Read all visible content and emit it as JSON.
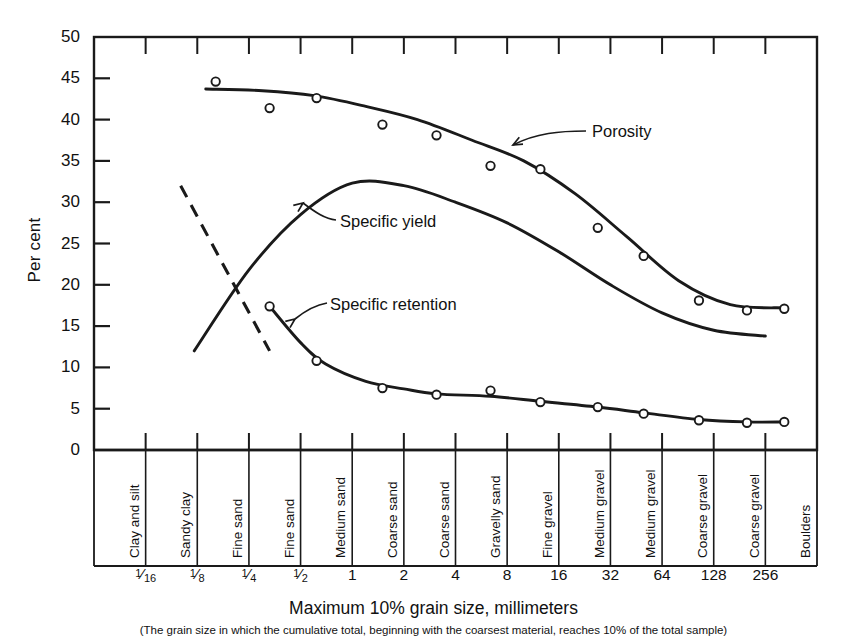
{
  "axes": {
    "ylabel": "Per cent",
    "xlabel": "Maximum 10% grain size, millimeters",
    "xnote": "(The grain size in which the cumulative total, beginning with the coarsest material, reaches 10% of the total sample)",
    "yticks": [
      "0",
      "5",
      "10",
      "15",
      "20",
      "25",
      "30",
      "35",
      "40",
      "45",
      "50"
    ]
  },
  "xticks": [
    {
      "label": "1/16",
      "num": "1",
      "den": "16"
    },
    {
      "label": "1/8",
      "num": "1",
      "den": "8"
    },
    {
      "label": "1/4",
      "num": "1",
      "den": "4"
    },
    {
      "label": "1/2",
      "num": "1",
      "den": "2"
    },
    {
      "label": "1"
    },
    {
      "label": "2"
    },
    {
      "label": "4"
    },
    {
      "label": "8"
    },
    {
      "label": "16"
    },
    {
      "label": "32"
    },
    {
      "label": "64"
    },
    {
      "label": "128"
    },
    {
      "label": "256"
    }
  ],
  "categories": [
    "Clay and silt",
    "Sandy clay",
    "Fine sand",
    "Fine sand",
    "Medium sand",
    "Coarse sand",
    "Coarse sand",
    "Gravelly sand",
    "Fine gravel",
    "Medium gravel",
    "Medium gravel",
    "Coarse gravel",
    "Coarse gravel",
    "Boulders"
  ],
  "curve_labels": {
    "porosity": "Porosity",
    "specific_yield": "Specific yield",
    "specific_retention": "Specific retention"
  },
  "chart_data": {
    "type": "line",
    "title": "",
    "xlabel": "Maximum 10% grain size, millimeters",
    "ylabel": "Per cent",
    "ylim": [
      0,
      50
    ],
    "ytick_step": 5,
    "grid": false,
    "legend": "inline-annotations",
    "x_scale": "log2 (category bands)",
    "x_tick_values": [
      0.0625,
      0.125,
      0.25,
      0.5,
      1,
      2,
      4,
      8,
      16,
      32,
      64,
      128,
      256
    ],
    "x_categories": [
      "Clay and silt",
      "Sandy clay",
      "Fine sand",
      "Fine sand",
      "Medium sand",
      "Coarse sand",
      "Coarse sand",
      "Gravelly sand",
      "Fine gravel",
      "Medium gravel",
      "Medium gravel",
      "Coarse gravel",
      "Coarse gravel",
      "Boulders"
    ],
    "series": [
      {
        "name": "Porosity",
        "marker": "open-circle",
        "line": "solid",
        "points": [
          {
            "x": 0.16,
            "y": 44.6
          },
          {
            "x": 0.33,
            "y": 41.4
          },
          {
            "x": 0.62,
            "y": 42.6
          },
          {
            "x": 1.5,
            "y": 39.4
          },
          {
            "x": 3.1,
            "y": 38.1
          },
          {
            "x": 6.4,
            "y": 34.4
          },
          {
            "x": 12.5,
            "y": 34.0
          },
          {
            "x": 27.0,
            "y": 26.9
          },
          {
            "x": 50.0,
            "y": 23.5
          },
          {
            "x": 105.0,
            "y": 18.1
          },
          {
            "x": 200.0,
            "y": 16.9
          },
          {
            "x": 330.0,
            "y": 17.1
          }
        ]
      },
      {
        "name": "Specific yield",
        "marker": "none",
        "line": "solid",
        "points": [
          {
            "x": 0.12,
            "y": 12.0
          },
          {
            "x": 0.25,
            "y": 21.8
          },
          {
            "x": 0.5,
            "y": 28.5
          },
          {
            "x": 1.0,
            "y": 32.3
          },
          {
            "x": 2.0,
            "y": 32.0
          },
          {
            "x": 4.0,
            "y": 30.0
          },
          {
            "x": 8.0,
            "y": 27.5
          },
          {
            "x": 16.0,
            "y": 24.0
          },
          {
            "x": 32.0,
            "y": 20.0
          },
          {
            "x": 64.0,
            "y": 16.6
          },
          {
            "x": 128.0,
            "y": 14.5
          },
          {
            "x": 256.0,
            "y": 13.8
          }
        ]
      },
      {
        "name": "Specific retention",
        "marker": "open-circle",
        "line": "solid-with-dashed-extension",
        "dashed_segment": [
          {
            "x": 0.1,
            "y": 32.0
          },
          {
            "x": 0.33,
            "y": 12.0
          }
        ],
        "points": [
          {
            "x": 0.33,
            "y": 17.4
          },
          {
            "x": 0.62,
            "y": 10.8
          },
          {
            "x": 1.5,
            "y": 7.5
          },
          {
            "x": 3.1,
            "y": 6.7
          },
          {
            "x": 6.4,
            "y": 7.2
          },
          {
            "x": 12.5,
            "y": 5.8
          },
          {
            "x": 27.0,
            "y": 5.2
          },
          {
            "x": 50.0,
            "y": 4.4
          },
          {
            "x": 105.0,
            "y": 3.6
          },
          {
            "x": 200.0,
            "y": 3.3
          },
          {
            "x": 330.0,
            "y": 3.4
          }
        ]
      }
    ]
  }
}
